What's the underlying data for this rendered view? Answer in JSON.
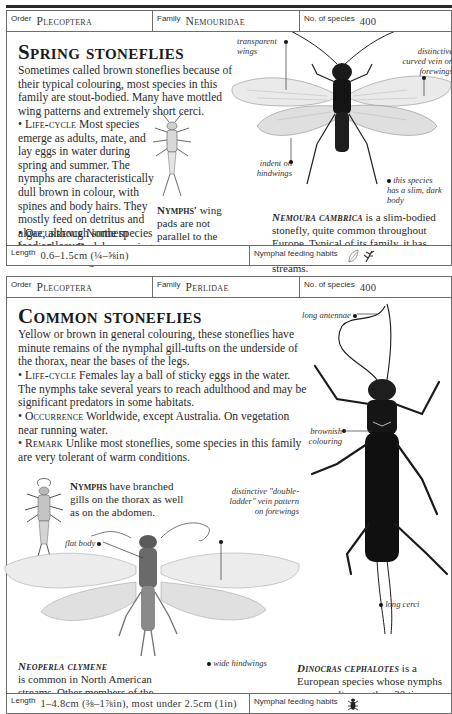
{
  "page": {
    "top_rule": true
  },
  "entries": [
    {
      "order_label": "Order",
      "order": "Plecoptera",
      "family_label": "Family",
      "family": "Nemouridae",
      "species_label": "No. of species",
      "species_count": "400",
      "title": "Spring stoneflies",
      "intro": "Sometimes called brown stoneflies because of their typical colouring, most species in this family are stout-bodied. Many have mottled wing patterns and extremely short cerci.",
      "sections": [
        {
          "key": "Life-cycle",
          "text": "Most species emerge as adults, mate, and lay eggs in water during spring and summer. The nymphs are characteristically dull brown in colour, with spines and body hairs. They mostly feed on detritus and algae, although some species feed on leaves."
        },
        {
          "key": "Occurrence",
          "text": "Northern hemisphere. By lakes, springs, and fast-flowing streams."
        }
      ],
      "nymph_caption": {
        "key": "Nymphs'",
        "text": "wing pads are not parallel to the body."
      },
      "species_caption": {
        "name": "Nemoura cambrica",
        "text": "is a slim-bodied stonefly, quite common throughout Europe. Typical of its family, it has brownish coloration and is found near streams."
      },
      "annotations": [
        {
          "text": "transparent wings"
        },
        {
          "text": "distinctive curved vein on forewings"
        },
        {
          "text": "indent on hindwings"
        },
        {
          "text": "this species has a slim, dark body"
        }
      ],
      "length_label": "Length",
      "length": "0.6–1.5cm (¼–⅝in)",
      "habits_label": "Nymphal feeding habits",
      "habits_icons": [
        "leaf-icon",
        "plant-detritus-icon"
      ]
    },
    {
      "order_label": "Order",
      "order": "Plecoptera",
      "family_label": "Family",
      "family": "Perlidae",
      "species_label": "No. of species",
      "species_count": "400",
      "title": "Common stoneflies",
      "intro": "Yellow or brown in general colouring, these stoneflies have minute remains of the nymphal gill-tufts on the underside of the thorax, near the bases of the legs.",
      "sections": [
        {
          "key": "Life-cycle",
          "text": "Females lay a ball of sticky eggs in the water. The nymphs take several years to reach adulthood and may be significant predators in some habitats."
        },
        {
          "key": "Occurrence",
          "text": "Worldwide, except Australia. On vegetation near running water."
        },
        {
          "key": "Remark",
          "text": "Unlike most stoneflies, some species in this family are very tolerant of warm conditions."
        }
      ],
      "nymph_caption": {
        "key": "Nymphs",
        "text": "have branched gills on the thorax as well as on the abdomen."
      },
      "species_caption_1": {
        "name": "Neoperla clymene",
        "text": "is common in North American streams. Other members of the genus favour broad rivers."
      },
      "species_caption_2": {
        "name": "Dinocras cephalotes",
        "text": "is a European species whose nymphs may moult more than 30 times and take up to five years to mature."
      },
      "annotations": [
        {
          "text": "long antennae"
        },
        {
          "text": "brownish colouring"
        },
        {
          "text": "distinctive \"double-ladder\" vein pattern on forewings"
        },
        {
          "text": "flat body"
        },
        {
          "text": "wide hindwings"
        },
        {
          "text": "long cerci"
        }
      ],
      "length_label": "Length",
      "length": "1–4.8cm (⅜–1⅞in), most under 2.5cm (1in)",
      "habits_label": "Nymphal feeding habits",
      "habits_icons": [
        "predator-insect-icon"
      ]
    }
  ]
}
